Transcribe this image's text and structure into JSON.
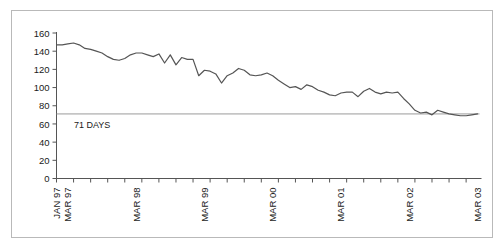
{
  "chart_data": {
    "type": "line",
    "title": "",
    "subtitle": "",
    "xlabel": "",
    "ylabel": "",
    "ylim": [
      0,
      160
    ],
    "ytick_values": [
      0,
      20,
      40,
      60,
      80,
      100,
      120,
      140,
      160
    ],
    "ytick_labels": [
      "0",
      "20",
      "40",
      "60",
      "80",
      "100",
      "120",
      "140",
      "160"
    ],
    "grid": false,
    "legend": null,
    "legend_position": "none",
    "series_color": "#555555",
    "reference_line_color": "#9a9a9a",
    "frame_color": "#b9b9b9",
    "xtick_labels": [
      "JAN 97",
      "MAR 97",
      "MAR 98",
      "MAR 99",
      "MAR 00",
      "MAR 01",
      "MAR 02",
      "MAR 03"
    ],
    "xtick_label_indices": [
      0,
      2,
      14,
      26,
      38,
      50,
      62,
      74
    ],
    "x_minor_tick_interval_months": 3,
    "n_points": 75,
    "annotations": [
      {
        "text": "71 DAYS",
        "value": 71,
        "type": "horizontal-reference-line"
      }
    ],
    "series": [
      {
        "name": "Days",
        "x": [
          "JAN 97",
          "FEB 97",
          "MAR 97",
          "APR 97",
          "MAY 97",
          "JUN 97",
          "JUL 97",
          "AUG 97",
          "SEP 97",
          "OCT 97",
          "NOV 97",
          "DEC 97",
          "JAN 98",
          "FEB 98",
          "MAR 98",
          "APR 98",
          "MAY 98",
          "JUN 98",
          "JUL 98",
          "AUG 98",
          "SEP 98",
          "OCT 98",
          "NOV 98",
          "DEC 98",
          "JAN 99",
          "FEB 99",
          "MAR 99",
          "APR 99",
          "MAY 99",
          "JUN 99",
          "JUL 99",
          "AUG 99",
          "SEP 99",
          "OCT 99",
          "NOV 99",
          "DEC 99",
          "JAN 00",
          "FEB 00",
          "MAR 00",
          "APR 00",
          "MAY 00",
          "JUN 00",
          "JUL 00",
          "AUG 00",
          "SEP 00",
          "OCT 00",
          "NOV 00",
          "DEC 00",
          "JAN 01",
          "FEB 01",
          "MAR 01",
          "APR 01",
          "MAY 01",
          "JUN 01",
          "JUL 01",
          "AUG 01",
          "SEP 01",
          "OCT 01",
          "NOV 01",
          "DEC 01",
          "JAN 02",
          "FEB 02",
          "MAR 02",
          "APR 02",
          "MAY 02",
          "JUN 02",
          "JUL 02",
          "AUG 02",
          "SEP 02",
          "OCT 02",
          "NOV 02",
          "DEC 02",
          "JAN 03",
          "FEB 03",
          "MAR 03"
        ],
        "values": [
          147,
          147,
          148,
          149,
          147,
          143,
          142,
          140,
          138,
          134,
          131,
          130,
          132,
          136,
          138,
          138,
          136,
          134,
          137,
          127,
          136,
          125,
          133,
          131,
          131,
          113,
          119,
          118,
          115,
          105,
          113,
          116,
          121,
          119,
          114,
          113,
          114,
          116,
          113,
          108,
          104,
          100,
          101,
          98,
          103,
          101,
          97,
          95,
          92,
          91,
          94,
          95,
          95,
          90,
          96,
          99,
          95,
          93,
          95,
          94,
          95,
          88,
          82,
          75,
          72,
          73,
          70,
          75,
          73,
          71,
          70,
          69,
          69,
          70,
          71
        ]
      }
    ]
  }
}
